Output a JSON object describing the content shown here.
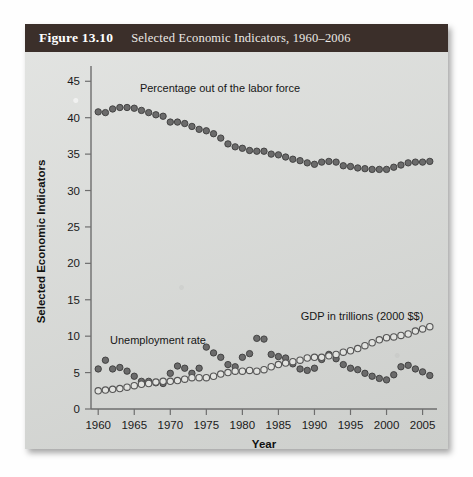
{
  "figure": {
    "number_label": "Figure 13.10",
    "caption": "Selected Economic Indicators, 1960–2006",
    "header_color": "#3b2f2a",
    "panel_color": "#d8dad7"
  },
  "chart_data": {
    "type": "scatter",
    "title": "Selected Economic Indicators, 1960–2006",
    "xlabel": "Year",
    "ylabel": "Selected Economic Indicators",
    "xlim": [
      1959,
      2007
    ],
    "ylim": [
      0,
      46
    ],
    "xticks": [
      1960,
      1965,
      1970,
      1975,
      1980,
      1985,
      1990,
      1995,
      2000,
      2005
    ],
    "yticks": [
      0,
      5,
      10,
      15,
      20,
      25,
      30,
      35,
      40,
      45
    ],
    "grid": false,
    "legend_position": "inline-annotations",
    "x": [
      1960,
      1961,
      1962,
      1963,
      1964,
      1965,
      1966,
      1967,
      1968,
      1969,
      1970,
      1971,
      1972,
      1973,
      1974,
      1975,
      1976,
      1977,
      1978,
      1979,
      1980,
      1981,
      1982,
      1983,
      1984,
      1985,
      1986,
      1987,
      1988,
      1989,
      1990,
      1991,
      1992,
      1993,
      1994,
      1995,
      1996,
      1997,
      1998,
      1999,
      2000,
      2001,
      2002,
      2003,
      2004,
      2005,
      2006
    ],
    "series": [
      {
        "name": "Percentage out of the labor force",
        "marker": "filled-circle",
        "color": "#6b6b6b",
        "annotation": "Percentage out of the labor force",
        "values": [
          40.8,
          40.7,
          41.2,
          41.4,
          41.4,
          41.3,
          41.0,
          40.7,
          40.4,
          40.2,
          39.4,
          39.4,
          39.2,
          38.8,
          38.4,
          38.2,
          37.8,
          37.2,
          36.4,
          36.0,
          35.8,
          35.5,
          35.4,
          35.4,
          35.0,
          34.9,
          34.6,
          34.3,
          34.1,
          33.8,
          33.6,
          33.9,
          34.0,
          33.9,
          33.4,
          33.3,
          33.1,
          33.0,
          32.9,
          32.9,
          32.9,
          33.2,
          33.5,
          33.8,
          33.9,
          33.9,
          34.0
        ]
      },
      {
        "name": "Unemployment rate",
        "marker": "filled-circle",
        "color": "#6b6b6b",
        "annotation": "Unemployment rate",
        "values": [
          5.5,
          6.7,
          5.5,
          5.7,
          5.2,
          4.5,
          3.8,
          3.8,
          3.6,
          3.5,
          4.9,
          5.9,
          5.6,
          4.9,
          5.6,
          8.5,
          7.7,
          7.1,
          6.1,
          5.8,
          7.1,
          7.6,
          9.7,
          9.6,
          7.5,
          7.2,
          7.0,
          6.2,
          5.5,
          5.3,
          5.6,
          6.8,
          7.5,
          6.9,
          6.1,
          5.6,
          5.4,
          4.9,
          4.5,
          4.2,
          4.0,
          4.7,
          5.8,
          6.0,
          5.5,
          5.1,
          4.6
        ]
      },
      {
        "name": "GDP in trillions (2000 $$)",
        "marker": "open-circle",
        "color": "#e2e3e0",
        "annotation": "GDP in trillions (2000 $$)",
        "values": [
          2.5,
          2.6,
          2.7,
          2.8,
          3.0,
          3.2,
          3.4,
          3.5,
          3.7,
          3.8,
          3.8,
          3.9,
          4.1,
          4.3,
          4.3,
          4.3,
          4.5,
          4.8,
          5.0,
          5.2,
          5.2,
          5.3,
          5.2,
          5.4,
          5.8,
          6.1,
          6.3,
          6.5,
          6.7,
          7.0,
          7.1,
          7.1,
          7.3,
          7.5,
          7.8,
          8.0,
          8.3,
          8.7,
          9.1,
          9.5,
          9.8,
          9.9,
          10.1,
          10.3,
          10.7,
          11.0,
          11.3
        ]
      }
    ]
  }
}
